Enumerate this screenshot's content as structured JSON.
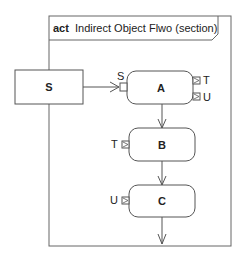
{
  "frame": {
    "keyword": "act",
    "title": "Indirect Object Flwo (section)"
  },
  "object_node": {
    "label": "S"
  },
  "actions": [
    {
      "id": "A",
      "label": "A"
    },
    {
      "id": "B",
      "label": "B"
    },
    {
      "id": "C",
      "label": "C"
    }
  ],
  "pins": {
    "a_input": "S",
    "a_output_1": "T",
    "a_output_2": "U",
    "b_input": "T",
    "c_input": "U"
  },
  "colors": {
    "stroke": "#555555",
    "text": "#222222",
    "background": "#ffffff"
  }
}
